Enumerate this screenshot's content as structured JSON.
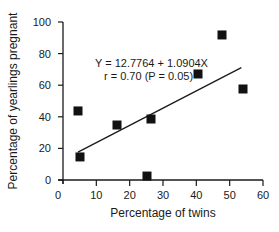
{
  "chart_data": {
    "type": "scatter",
    "title": "",
    "xlabel": "Percentage of twins",
    "ylabel": "Percentage of yearlings pregnant",
    "xlim": [
      0,
      60
    ],
    "ylim": [
      0,
      100
    ],
    "xticks": [
      0,
      10,
      20,
      30,
      40,
      50,
      60
    ],
    "yticks": [
      0,
      20,
      40,
      60,
      80,
      100
    ],
    "grid": false,
    "legend": null,
    "series": [
      {
        "name": "observations",
        "marker": "square",
        "points": [
          {
            "x": 4.5,
            "y": 43.7
          },
          {
            "x": 5.1,
            "y": 14.6
          },
          {
            "x": 16.2,
            "y": 34.8
          },
          {
            "x": 25.2,
            "y": 2.5
          },
          {
            "x": 26.4,
            "y": 38.6
          },
          {
            "x": 40.5,
            "y": 67.1
          },
          {
            "x": 47.7,
            "y": 91.8
          },
          {
            "x": 54.0,
            "y": 57.6
          }
        ]
      }
    ],
    "regression": {
      "intercept": 12.7764,
      "slope": 1.0904,
      "x_start": 4.5,
      "x_end": 53.5
    },
    "annotations": [
      "Y = 12.7764 + 1.0904X",
      "r = 0.70 (P = 0.05)"
    ]
  },
  "labels": {
    "xlabel": "Percentage of twins",
    "ylabel": "Percentage of yearlings pregnant",
    "equation": "Y = 12.7764 + 1.0904X",
    "correlation": "r = 0.70 (P = 0.05)",
    "xticks": [
      "0",
      "10",
      "20",
      "30",
      "40",
      "50",
      "60"
    ],
    "yticks": [
      "0",
      "20",
      "40",
      "60",
      "80",
      "100"
    ]
  }
}
